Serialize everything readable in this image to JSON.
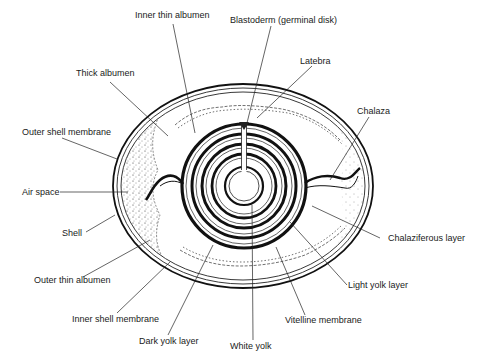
{
  "diagram": {
    "labels": {
      "inner_thin_albumen": "Inner thin albumen",
      "blastoderm": "Blastoderm (germinal disk)",
      "latebra": "Latebra",
      "thick_albumen": "Thick albumen",
      "chalaza": "Chalaza",
      "outer_shell_membrane": "Outer shell membrane",
      "air_space": "Air space",
      "shell": "Shell",
      "chalaziferous_layer": "Chalaziferous layer",
      "outer_thin_albumen": "Outer thin albumen",
      "light_yolk_layer": "Light yolk layer",
      "inner_shell_membrane": "Inner shell membrane",
      "vitelline_membrane": "Vitelline membrane",
      "dark_yolk_layer": "Dark yolk layer",
      "white_yolk": "White yolk"
    },
    "colors": {
      "ink": "#1a1a1a",
      "background": "#ffffff"
    }
  }
}
